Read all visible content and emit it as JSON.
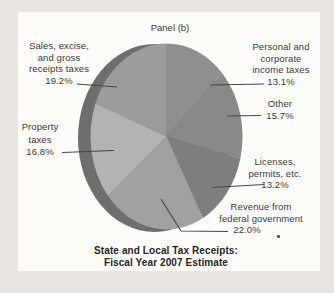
{
  "page": {
    "background_color": "#ebe5e2",
    "panel_background": "#fdfcf9",
    "text_color": "#3a3a3a"
  },
  "chart_data": {
    "type": "pie",
    "panel_label": "Panel (b)",
    "title": "State and Local Tax Receipts:\nFiscal Year 2007 Estimate",
    "direction": "clockwise",
    "start_angle_deg": 0,
    "rim_color": "#6e6e6e",
    "leader_line_color": "#454545",
    "slices": [
      {
        "label": "Personal and\ncorporate\nincome taxes",
        "pct": "13.1%",
        "value": 13.1,
        "color": "#8f8f8f"
      },
      {
        "label": "Other",
        "pct": "15.7%",
        "value": 15.7,
        "color": "#898989"
      },
      {
        "label": "Licenses,\npermits, etc.",
        "pct": "13.2%",
        "value": 13.2,
        "color": "#7e7e7e"
      },
      {
        "label": "Revenue from\nfederal government",
        "pct": "22.0%",
        "value": 22.0,
        "color": "#a1a1a1"
      },
      {
        "label": "Property\ntaxes",
        "pct": "16.8%",
        "value": 16.8,
        "color": "#b3b3b3"
      },
      {
        "label": "Sales, excise,\nand gross\nreceipts taxes",
        "pct": "19.2%",
        "value": 19.2,
        "color": "#9c9c9c"
      }
    ]
  }
}
